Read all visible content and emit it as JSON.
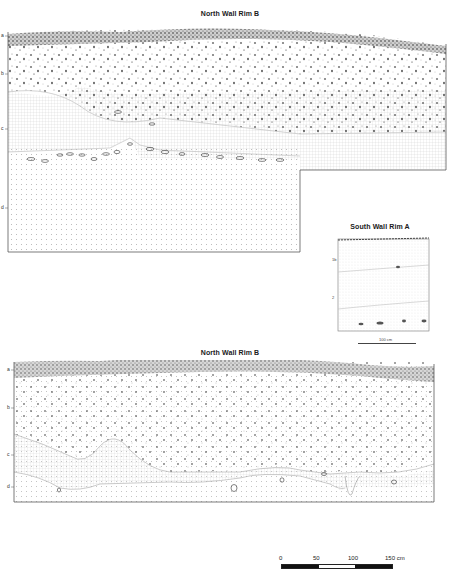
{
  "figure": {
    "panels": [
      {
        "id": "north-wall-top",
        "title": "North Wall Rim B",
        "layer_labels": [
          "a",
          "b",
          "c",
          "d"
        ],
        "layers": [
          {
            "name": "a",
            "description": "dense dark humus top layer with stones"
          },
          {
            "name": "b",
            "description": "stony layer with scattered gravel"
          },
          {
            "name": "c",
            "description": "grid-hatched fill layer with stone line"
          },
          {
            "name": "d",
            "description": "fine dotted base layer"
          }
        ]
      },
      {
        "id": "south-wall-inset",
        "title": "South Wall Rim A",
        "layer_labels": [
          "1b",
          "2"
        ],
        "scale_label": "100 cm"
      },
      {
        "id": "north-wall-bottom",
        "title": "North Wall Rim B",
        "layer_labels": [
          "a",
          "b",
          "c",
          "d"
        ]
      }
    ],
    "scale_bar": {
      "ticks": [
        "0",
        "50",
        "100",
        "150 cm"
      ],
      "segments": [
        "black",
        "white",
        "black"
      ]
    },
    "colors": {
      "ink": "#1a1a1a",
      "hatch": "#9a9a9a",
      "background": "#ffffff"
    }
  }
}
